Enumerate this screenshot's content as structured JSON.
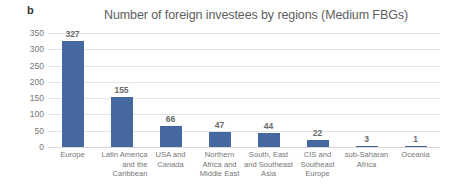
{
  "panel": {
    "letter": "b"
  },
  "chart_data": {
    "type": "bar",
    "title": "Number of foreign investees by regions (Medium FBGs)",
    "xlabel": "",
    "ylabel": "",
    "ylim": [
      0,
      350
    ],
    "yticks": [
      350,
      300,
      250,
      200,
      150,
      100,
      50,
      0
    ],
    "grid": true,
    "legend": false,
    "bar_color": "#45689f",
    "categories": [
      "Europe",
      "Latin America and the Caribbean",
      "USA and Canada",
      "Northern Africa and Middle East",
      "South, East and Southeast Asia",
      "CIS and Southeast Europe",
      "sub-Saharan Africa",
      "Oceania"
    ],
    "category_lines": [
      [
        "Europe"
      ],
      [
        "Latin America",
        "and the",
        "Caribbean"
      ],
      [
        "USA and",
        "Canada"
      ],
      [
        "Northern",
        "Africa and",
        "Middle East"
      ],
      [
        "South, East",
        "and Southeast",
        "Asia"
      ],
      [
        "CIS and",
        "Southeast",
        "Europe"
      ],
      [
        "sub-Saharan",
        "Africa"
      ],
      [
        "Oceania"
      ]
    ],
    "values": [
      327,
      155,
      66,
      47,
      44,
      22,
      3,
      1
    ],
    "value_labels": [
      "327",
      "155",
      "66",
      "47",
      "44",
      "22",
      "3",
      "1"
    ]
  }
}
